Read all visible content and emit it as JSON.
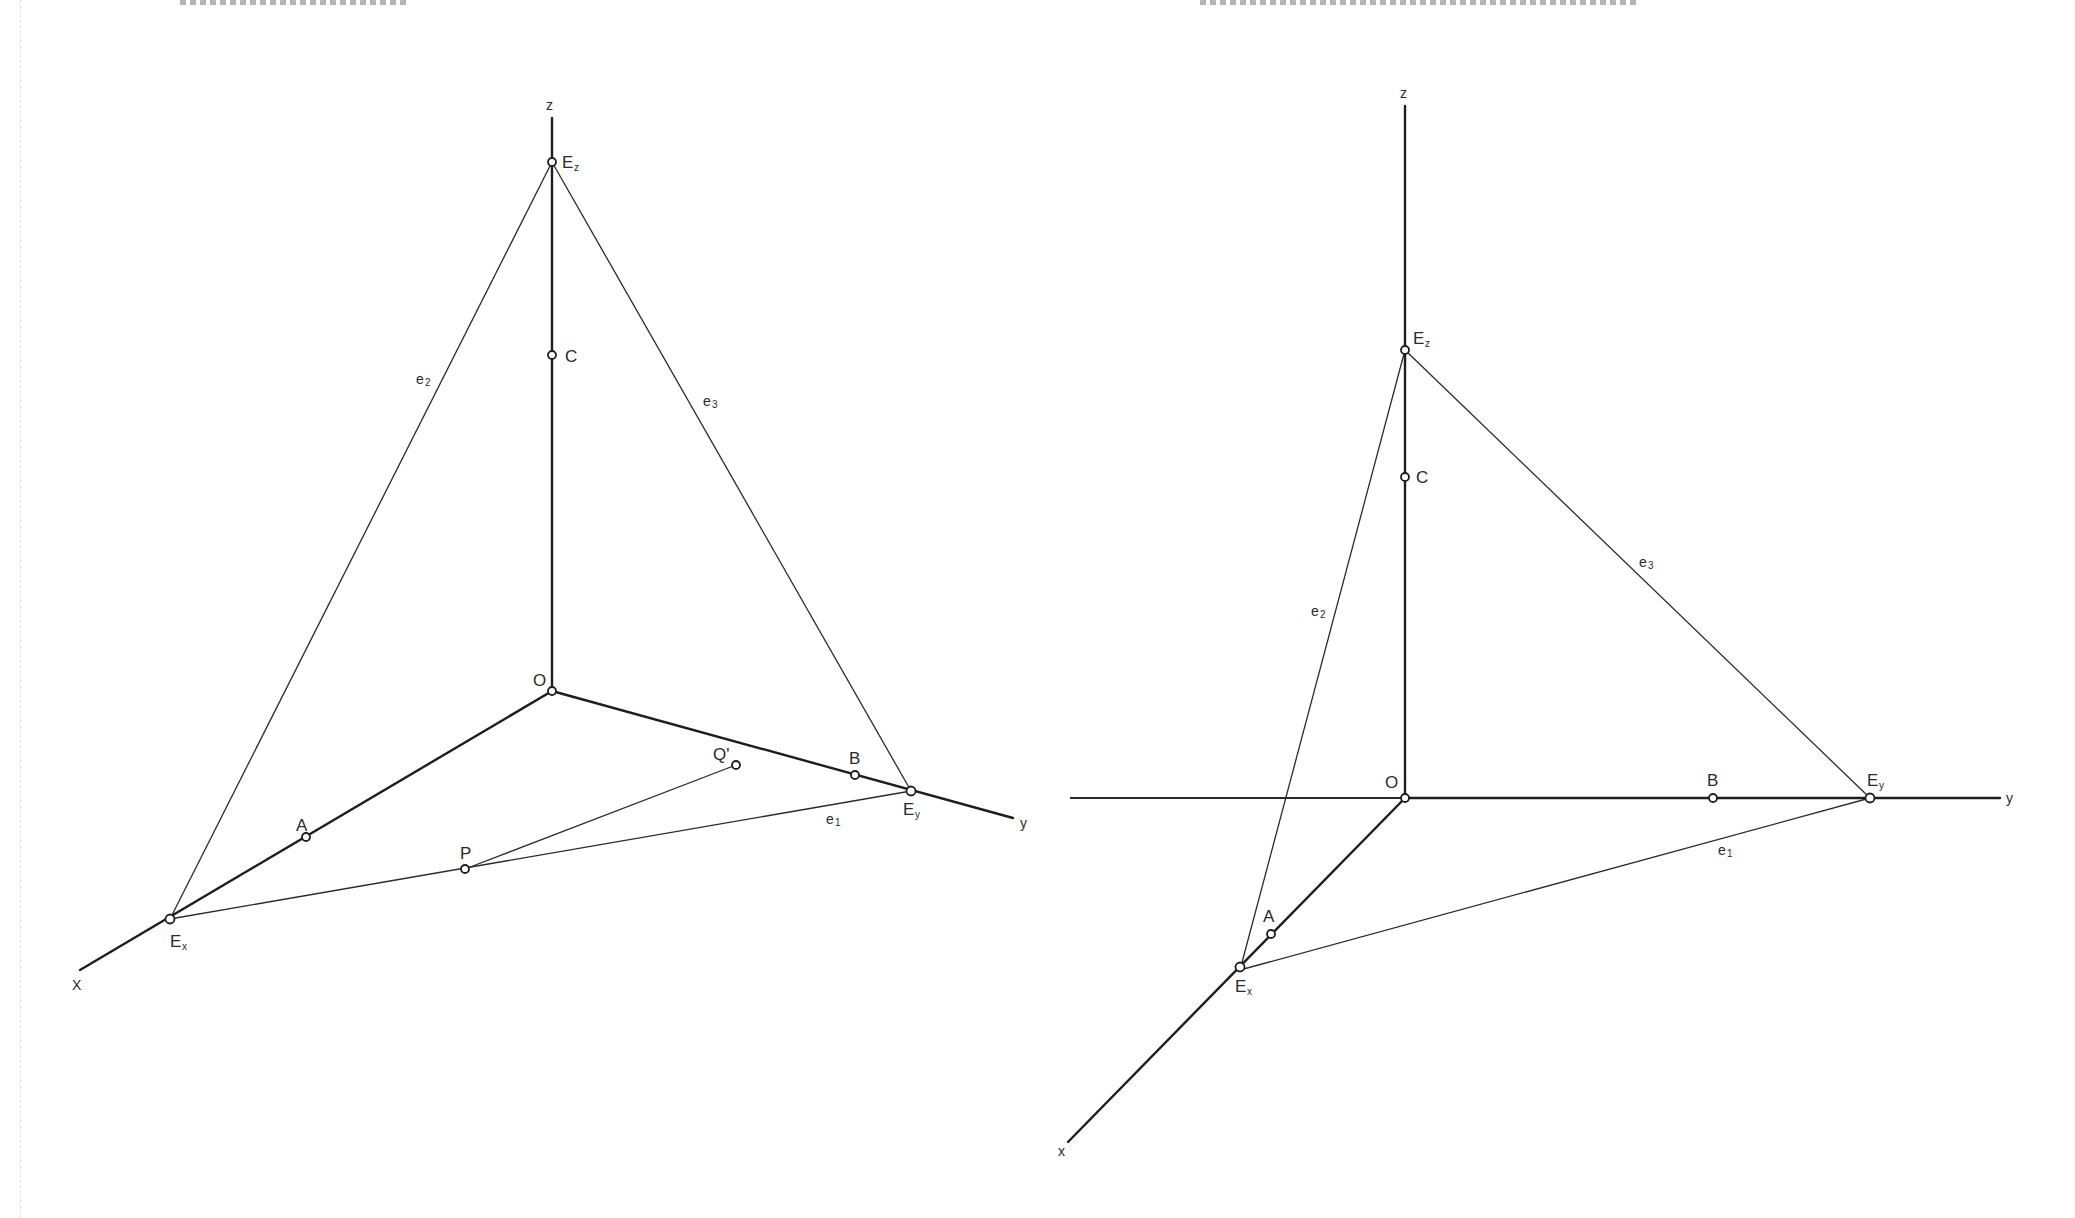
{
  "figures": [
    {
      "id": "left",
      "description": "Oblique axonometric axes with trace triangle (skewed)",
      "axis_labels": {
        "x": "X",
        "y": "y",
        "z": "z"
      },
      "origin_label": "O",
      "points": {
        "Ez": {
          "label": "E",
          "sub": "z"
        },
        "Ex": {
          "label": "E",
          "sub": "x"
        },
        "Ey": {
          "label": "E",
          "sub": "y"
        },
        "A": {
          "label": "A"
        },
        "B": {
          "label": "B"
        },
        "C": {
          "label": "C"
        },
        "P": {
          "label": "P"
        },
        "Q": {
          "label": "Q'"
        }
      },
      "traces": {
        "e1": {
          "label": "e",
          "sub": "1"
        },
        "e2": {
          "label": "e",
          "sub": "2"
        },
        "e3": {
          "label": "e",
          "sub": "3"
        }
      }
    },
    {
      "id": "right",
      "description": "Cavalier-style axes with horizontal y-axis and trace triangle",
      "axis_labels": {
        "x": "x",
        "y": "y",
        "z": "z"
      },
      "origin_label": "O",
      "points": {
        "Ez": {
          "label": "E",
          "sub": "z"
        },
        "Ex": {
          "label": "E",
          "sub": "x"
        },
        "Ey": {
          "label": "E",
          "sub": "y"
        },
        "A": {
          "label": "A"
        },
        "B": {
          "label": "B"
        },
        "C": {
          "label": "C"
        }
      },
      "traces": {
        "e1": {
          "label": "e",
          "sub": "1"
        },
        "e2": {
          "label": "e",
          "sub": "2"
        },
        "e3": {
          "label": "e",
          "sub": "3"
        }
      }
    }
  ]
}
